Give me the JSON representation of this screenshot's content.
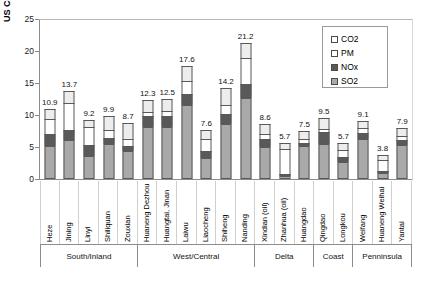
{
  "chart_data": {
    "type": "bar",
    "subtype": "stacked-column",
    "title": "",
    "xlabel": "",
    "ylabel": "US Cents per kWh",
    "ylim": [
      0,
      25
    ],
    "yticks": [
      "0",
      "5",
      "10",
      "15",
      "20",
      "25"
    ],
    "grid": false,
    "legend_position": "top-right",
    "legend": [
      "CO2",
      "PM",
      "NOx",
      "SO2"
    ],
    "stack_order_bottom_to_top": [
      "SO2",
      "NOx",
      "PM",
      "CO2"
    ],
    "categories": [
      "Heze",
      "Jining",
      "Linyi",
      "Shiliquan",
      "Zouxian",
      "Huaneng Dezhou",
      "Huangtai, Jinan",
      "Laiwu",
      "Liaocheng",
      "Shiheng",
      "Nanding",
      "Xindian (oil)",
      "Zhanhua (oil)",
      "Huangdao",
      "Qingdao",
      "Longkou",
      "Weifang",
      "Huaneng Weihai",
      "Yantai"
    ],
    "totals": [
      10.9,
      13.7,
      9.2,
      9.9,
      8.7,
      12.3,
      12.5,
      17.6,
      7.6,
      14.2,
      21.2,
      8.6,
      5.7,
      7.5,
      9.5,
      5.7,
      9.1,
      3.8,
      7.9
    ],
    "series": [
      {
        "name": "SO2",
        "color": "#a9a9a9",
        "values": [
          5.1,
          6.1,
          3.6,
          5.4,
          4.4,
          8.1,
          8.2,
          11.5,
          3.3,
          8.6,
          12.6,
          5.0,
          0.5,
          5.1,
          5.5,
          2.6,
          6.3,
          0.9,
          5.3
        ]
      },
      {
        "name": "NOx",
        "color": "#595959",
        "values": [
          1.9,
          1.5,
          1.7,
          1.0,
          0.7,
          1.7,
          1.7,
          1.8,
          1.1,
          1.5,
          2.3,
          1.3,
          0.3,
          0.6,
          1.8,
          0.9,
          0.9,
          0.4,
          0.8
        ]
      },
      {
        "name": "PM",
        "color": "#ffffff",
        "values": [
          2.4,
          4.3,
          2.8,
          1.3,
          1.1,
          0.6,
          0.7,
          2.0,
          1.8,
          1.5,
          4.0,
          0.7,
          3.9,
          0.5,
          0.5,
          1.0,
          0.7,
          1.6,
          0.6
        ]
      },
      {
        "name": "CO2",
        "color": "#ededed",
        "values": [
          1.5,
          1.8,
          1.1,
          2.2,
          2.5,
          1.9,
          1.9,
          2.3,
          1.4,
          2.6,
          2.3,
          1.6,
          1.0,
          1.3,
          1.7,
          1.2,
          1.2,
          0.9,
          1.2
        ]
      }
    ],
    "groups": [
      {
        "label": "South/Inland",
        "start": 0,
        "count": 5
      },
      {
        "label": "West/Central",
        "start": 5,
        "count": 6
      },
      {
        "label": "Delta",
        "start": 11,
        "count": 3
      },
      {
        "label": "Coast",
        "start": 14,
        "count": 2
      },
      {
        "label": "Penninsula",
        "start": 16,
        "count": 3
      }
    ]
  }
}
